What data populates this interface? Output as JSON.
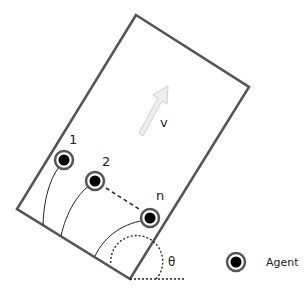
{
  "diagram": {
    "type": "multi-agent formation in rotated rectangle",
    "colors": {
      "frame": "#555555",
      "agent_ring": "#555555",
      "agent_core": "#000000",
      "arrow_fill": "#eeeeee",
      "arrow_stroke": "#cfcfcf",
      "dashed": "#222222",
      "text": "#222222"
    },
    "velocity": {
      "label": "v"
    },
    "angle": {
      "label": "θ"
    },
    "agents": [
      {
        "id": "1",
        "label": "1"
      },
      {
        "id": "2",
        "label": "2"
      },
      {
        "id": "n",
        "label": "n"
      }
    ],
    "legend": {
      "icon": "agent-icon",
      "label": "Agent"
    }
  }
}
